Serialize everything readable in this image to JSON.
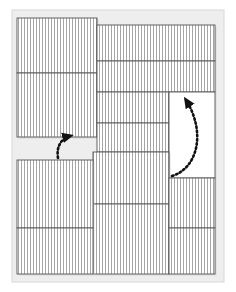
{
  "figure": {
    "type": "technical-line-drawing",
    "canvas": {
      "width": 236,
      "height": 292
    },
    "colors": {
      "background": "#ffffff",
      "plate_background": "#eeeeee",
      "panel_fill": "#ffffff",
      "panel_stroke": "#555555",
      "hatch_stroke": "#666666",
      "arrow_stroke": "#111111",
      "shadow": "#cccccc"
    },
    "style": {
      "hatch_spacing_px": 3,
      "hatch_direction": "vertical",
      "panel_stroke_width_px": 0.9,
      "hatch_stroke_width_px": 0.55,
      "arrow_dash_pattern": "1.6 2.6",
      "arrow_stroke_width_px": 2.6
    },
    "plate": {
      "x": 12,
      "y": 10,
      "width": 212,
      "height": 272
    },
    "panels": [
      {
        "id": "p1",
        "name": "top-left-upper-panel",
        "x": 17,
        "y": 18,
        "width": 80,
        "height": 55,
        "hatched": true
      },
      {
        "id": "p2",
        "name": "top-left-lower-panel",
        "x": 17,
        "y": 73,
        "width": 80,
        "height": 64,
        "hatched": true
      },
      {
        "id": "p3",
        "name": "top-right-upper-panel",
        "x": 97,
        "y": 25,
        "width": 118,
        "height": 36,
        "hatched": true
      },
      {
        "id": "p4",
        "name": "top-right-mid-panel",
        "x": 97,
        "y": 61,
        "width": 118,
        "height": 31,
        "hatched": true
      },
      {
        "id": "p5",
        "name": "center-upper-panel",
        "x": 97,
        "y": 92,
        "width": 72,
        "height": 31,
        "hatched": true
      },
      {
        "id": "p6",
        "name": "center-lower-panel",
        "x": 97,
        "y": 123,
        "width": 72,
        "height": 29,
        "hatched": true
      },
      {
        "id": "p7",
        "name": "right-swing-panel",
        "x": 169,
        "y": 92,
        "width": 46,
        "height": 86,
        "hatched": false
      },
      {
        "id": "p8",
        "name": "center-mid-panel",
        "x": 93,
        "y": 152,
        "width": 76,
        "height": 52,
        "hatched": true
      },
      {
        "id": "p9",
        "name": "center-bottom-panel",
        "x": 93,
        "y": 204,
        "width": 76,
        "height": 70,
        "hatched": true
      },
      {
        "id": "p10",
        "name": "bottom-left-upper-panel",
        "x": 17,
        "y": 160,
        "width": 76,
        "height": 68,
        "hatched": true
      },
      {
        "id": "p11",
        "name": "bottom-left-lower-panel",
        "x": 17,
        "y": 228,
        "width": 76,
        "height": 46,
        "hatched": true
      },
      {
        "id": "p12",
        "name": "bottom-right-upper-panel",
        "x": 169,
        "y": 178,
        "width": 46,
        "height": 50,
        "hatched": true
      },
      {
        "id": "p13",
        "name": "bottom-right-lower-panel",
        "x": 169,
        "y": 228,
        "width": 46,
        "height": 46,
        "hatched": true
      }
    ],
    "arrows": [
      {
        "id": "a1",
        "name": "small-swing-arrow",
        "path": "M 58 158 C 56 146, 62 138, 70 136",
        "head_at": {
          "x": 70,
          "y": 136
        },
        "head_angle_deg": -25,
        "description": "short dotted curved arrow at left notch"
      },
      {
        "id": "a2",
        "name": "large-swing-arrow",
        "path": "M 172 176 C 198 168, 206 132, 186 100",
        "head_at": {
          "x": 186,
          "y": 100
        },
        "head_angle_deg": -120,
        "description": "large dotted curved arrow over right swing panel"
      }
    ]
  }
}
